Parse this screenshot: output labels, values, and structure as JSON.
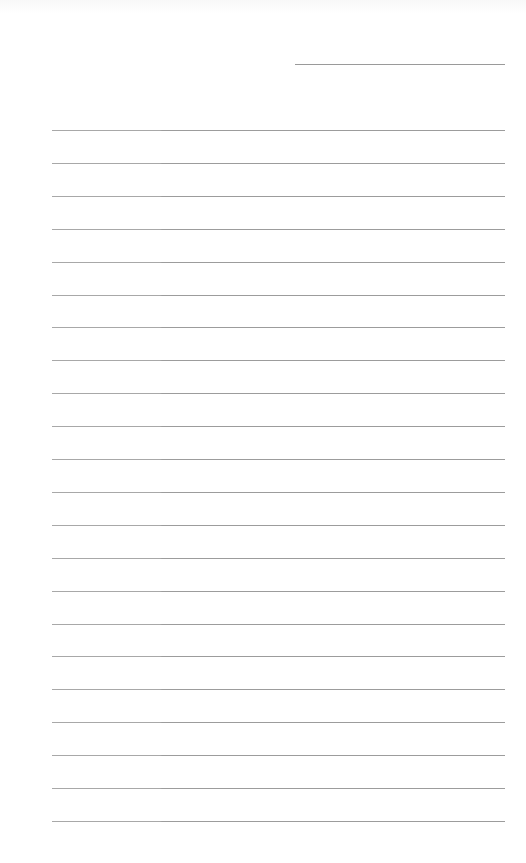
{
  "page": {
    "type": "lined-paper",
    "background_color": "#ffffff",
    "line_color": "#a0a0a0",
    "header_line": {
      "top": 64,
      "left": 295,
      "width": 210
    },
    "ruled_lines": {
      "count": 22,
      "first_top": 130,
      "spacing": 32.9,
      "left": 52,
      "width": 453
    }
  }
}
